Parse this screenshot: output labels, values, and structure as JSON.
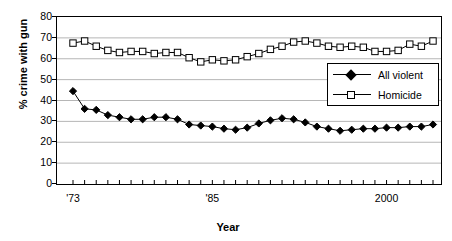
{
  "chart_data": {
    "type": "line",
    "title": "",
    "xlabel": "Year",
    "ylabel": "% crime with gun",
    "ylim": [
      0,
      80
    ],
    "ytick_values": [
      0,
      10,
      20,
      30,
      40,
      50,
      60,
      70,
      80
    ],
    "ytick_labels": [
      "0",
      "10",
      "20",
      "30",
      "40",
      "50",
      "60",
      "70",
      "80"
    ],
    "grid": "horizontal",
    "legend_position": "center-right",
    "xlim": [
      1973,
      2004
    ],
    "xtick_labels_shown": [
      "'73",
      "'85",
      "2000"
    ],
    "xtick_label_values": [
      1973,
      1985,
      2000
    ],
    "x": [
      1973,
      1974,
      1975,
      1976,
      1977,
      1978,
      1979,
      1980,
      1981,
      1982,
      1983,
      1984,
      1985,
      1986,
      1987,
      1988,
      1989,
      1990,
      1991,
      1992,
      1993,
      1994,
      1995,
      1996,
      1997,
      1998,
      1999,
      2000,
      2001,
      2002,
      2003,
      2004
    ],
    "series": [
      {
        "name": "All violent",
        "marker": "filled-diamond",
        "color": "#000000",
        "values": [
          44.5,
          36.0,
          35.5,
          33.0,
          32.0,
          31.0,
          31.0,
          32.0,
          32.0,
          31.0,
          28.5,
          28.0,
          27.5,
          26.5,
          26.0,
          27.0,
          29.0,
          30.5,
          31.5,
          31.0,
          29.5,
          27.5,
          26.5,
          25.5,
          26.0,
          26.5,
          26.5,
          27.0,
          27.0,
          27.5,
          27.5,
          28.5
        ]
      },
      {
        "name": "Homicide",
        "marker": "open-square",
        "color": "#000000",
        "values": [
          67.5,
          68.5,
          66.0,
          64.0,
          63.0,
          63.5,
          63.5,
          62.5,
          63.0,
          63.0,
          60.5,
          58.5,
          59.5,
          59.0,
          59.5,
          61.0,
          62.5,
          64.5,
          66.0,
          68.0,
          68.5,
          67.5,
          66.0,
          65.5,
          66.0,
          65.5,
          63.5,
          63.5,
          64.0,
          67.0,
          66.0,
          68.5
        ]
      }
    ]
  },
  "legend": {
    "items": [
      {
        "label": "All violent",
        "marker": "filled-diamond"
      },
      {
        "label": "Homicide",
        "marker": "open-square"
      }
    ]
  },
  "axes": {
    "y_title": "% crime with gun",
    "x_title": "Year"
  }
}
